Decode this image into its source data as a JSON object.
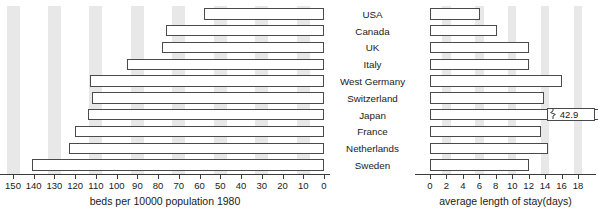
{
  "chart_data": [
    {
      "type": "bar",
      "orientation": "horizontal",
      "direction": "right-to-left",
      "title": "",
      "xlabel": "beds per 10000 population 1980",
      "ylabel": "",
      "categories": [
        "USA",
        "Canada",
        "UK",
        "Italy",
        "West Germany",
        "Switzerland",
        "Japan",
        "France",
        "Netherlands",
        "Sweden"
      ],
      "values": [
        58,
        76,
        78,
        95,
        113,
        112,
        114,
        120,
        123,
        141
      ],
      "xlim": [
        0,
        150
      ],
      "xticks": [
        150,
        140,
        130,
        120,
        110,
        100,
        90,
        80,
        70,
        60,
        50,
        40,
        30,
        20,
        10,
        0
      ],
      "xticklabels": [
        "150",
        "140",
        "130",
        "120",
        "110",
        "100",
        "90",
        "80",
        "70",
        "60",
        "50",
        "40",
        "30",
        "20",
        "10",
        "0"
      ],
      "grid": false,
      "banded_background": true,
      "legend": "none"
    },
    {
      "type": "bar",
      "orientation": "horizontal",
      "direction": "left-to-right",
      "title": "",
      "xlabel": "average length of stay(days)",
      "ylabel": "",
      "categories": [
        "USA",
        "Canada",
        "UK",
        "Italy",
        "West Germany",
        "Switzerland",
        "Japan",
        "France",
        "Netherlands",
        "Sweden"
      ],
      "values": [
        6.1,
        8.2,
        12.0,
        12.1,
        16.1,
        13.9,
        42.9,
        13.5,
        14.4,
        12.0
      ],
      "xlim": [
        0,
        18
      ],
      "xticks": [
        0,
        2,
        4,
        6,
        8,
        10,
        12,
        14,
        16,
        18
      ],
      "xticklabels": [
        "0",
        "2",
        "4",
        "6",
        "8",
        "10",
        "12",
        "14",
        "16",
        "18"
      ],
      "grid": false,
      "banded_background": true,
      "legend": "none",
      "annotations": [
        {
          "category": "Japan",
          "value": 42.9,
          "label": "42.9",
          "type": "axis-break",
          "note": "bar truncated with break symbol"
        }
      ]
    }
  ],
  "left_axis": {
    "title": "beds per 10000 population 1980",
    "ticklabels": [
      "150",
      "140",
      "130",
      "120",
      "110",
      "100",
      "90",
      "80",
      "70",
      "60",
      "50",
      "40",
      "30",
      "20",
      "10",
      "0"
    ]
  },
  "right_axis": {
    "title": "average length of stay(days)",
    "ticklabels": [
      "0",
      "2",
      "4",
      "6",
      "8",
      "10",
      "12",
      "14",
      "16",
      "18"
    ]
  },
  "countries": [
    "USA",
    "Canada",
    "UK",
    "Italy",
    "West Germany",
    "Switzerland",
    "Japan",
    "France",
    "Netherlands",
    "Sweden"
  ],
  "japan_break": {
    "value_label": "42.9",
    "break_icon": "axis-break-icon"
  },
  "colors": {
    "bar_fill": "#ffffff",
    "bar_stroke": "#4a4a4a",
    "band": "#e8e8e8",
    "background": "#ffffff",
    "text": "#1a1a1a"
  }
}
